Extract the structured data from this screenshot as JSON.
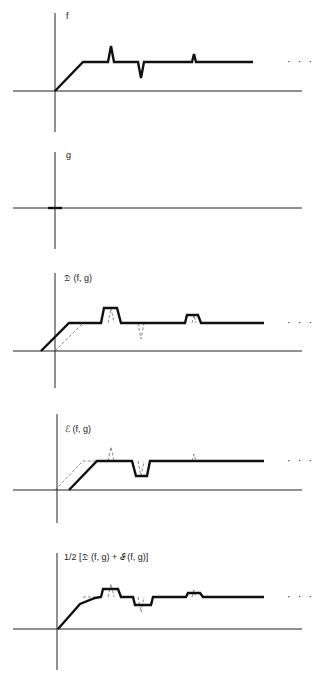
{
  "panels": [
    {
      "id": "f",
      "label": "f",
      "label_pos": [
        66,
        19
      ],
      "axes": {
        "vx": 55,
        "vy": [
          13,
          132
        ],
        "hy": 91,
        "hx": [
          13,
          302
        ]
      },
      "thick": [
        [
          [
            55,
            91
          ],
          [
            83,
            62
          ],
          [
            108,
            62
          ],
          [
            111,
            46
          ],
          [
            114,
            62
          ],
          [
            138,
            62
          ],
          [
            141,
            78
          ],
          [
            144,
            62
          ],
          [
            192,
            62
          ],
          [
            194,
            54
          ],
          [
            196,
            62
          ],
          [
            253,
            62
          ]
        ]
      ],
      "dashed": [],
      "ellipsis": "· · ·",
      "ellipsis_pos": [
        287,
        65
      ]
    },
    {
      "id": "g",
      "label": "g",
      "label_pos": [
        66,
        158
      ],
      "axes": {
        "vx": 55,
        "vy": [
          152,
          249
        ],
        "hy": 208,
        "hx": [
          13,
          302
        ]
      },
      "thick": [
        [
          [
            48,
            208
          ],
          [
            62,
            208
          ]
        ]
      ],
      "dashed": [],
      "ellipsis": "",
      "ellipsis_pos": [
        0,
        0
      ]
    },
    {
      "id": "dilation",
      "label": "𝔇 (f, g)",
      "label_pos": [
        64,
        281
      ],
      "axes": {
        "vx": 55,
        "vy": [
          273,
          388
        ],
        "hy": 351,
        "hx": [
          13,
          302
        ]
      },
      "thick": [
        [
          [
            41,
            351
          ],
          [
            69,
            323
          ],
          [
            101,
            323
          ],
          [
            104,
            308
          ],
          [
            117,
            308
          ],
          [
            121,
            323
          ],
          [
            185,
            323
          ],
          [
            187,
            315
          ],
          [
            198,
            315
          ],
          [
            201,
            323
          ],
          [
            264,
            323
          ]
        ]
      ],
      "dashed": [
        [
          [
            55,
            351
          ],
          [
            83,
            323
          ]
        ],
        [
          [
            108,
            323
          ],
          [
            111,
            308
          ],
          [
            114,
            323
          ]
        ],
        [
          [
            138,
            323
          ],
          [
            141,
            339
          ],
          [
            144,
            323
          ]
        ],
        [
          [
            192,
            323
          ],
          [
            194,
            315
          ],
          [
            196,
            323
          ]
        ]
      ],
      "ellipsis": "· · ·",
      "ellipsis_pos": [
        287,
        326
      ]
    },
    {
      "id": "erosion",
      "label": "ℰ (f, g)",
      "label_pos": [
        65,
        432
      ],
      "axes": {
        "vx": 57,
        "vy": [
          414,
          523
        ],
        "hy": 490,
        "hx": [
          13,
          302
        ]
      },
      "thick": [
        [
          [
            69,
            490
          ],
          [
            97,
            461
          ],
          [
            132,
            461
          ],
          [
            136,
            476
          ],
          [
            147,
            476
          ],
          [
            150,
            461
          ],
          [
            264,
            461
          ]
        ]
      ],
      "dashed": [
        [
          [
            55,
            490
          ],
          [
            83,
            461
          ],
          [
            97,
            461
          ]
        ],
        [
          [
            108,
            461
          ],
          [
            111,
            447
          ],
          [
            114,
            461
          ]
        ],
        [
          [
            138,
            461
          ],
          [
            141,
            476
          ],
          [
            144,
            461
          ]
        ],
        [
          [
            192,
            461
          ],
          [
            194,
            454
          ],
          [
            196,
            461
          ]
        ]
      ],
      "ellipsis": "· · ·",
      "ellipsis_pos": [
        287,
        464
      ]
    },
    {
      "id": "average",
      "label": "1/2 [𝔇 (f, g) + ℰ (f, g)]",
      "label_pos": [
        64,
        560
      ],
      "axes": {
        "vx": 57,
        "vy": [
          553,
          670
        ],
        "hy": 629,
        "hx": [
          13,
          302
        ]
      },
      "thick": [
        [
          [
            58,
            629
          ],
          [
            80,
            604
          ],
          [
            95,
            598
          ],
          [
            101,
            597
          ],
          [
            103,
            589
          ],
          [
            118,
            589
          ],
          [
            121,
            597
          ],
          [
            133,
            597
          ],
          [
            135,
            605
          ],
          [
            151,
            605
          ],
          [
            153,
            597
          ],
          [
            186,
            597
          ],
          [
            188,
            593
          ],
          [
            200,
            593
          ],
          [
            203,
            597
          ],
          [
            264,
            597
          ]
        ]
      ],
      "dashed": [
        [
          [
            83,
            597
          ],
          [
            95,
            597
          ]
        ],
        [
          [
            108,
            597
          ],
          [
            111,
            584
          ],
          [
            114,
            597
          ]
        ],
        [
          [
            138,
            597
          ],
          [
            141,
            612
          ],
          [
            144,
            597
          ]
        ],
        [
          [
            192,
            597
          ],
          [
            194,
            590
          ],
          [
            196,
            597
          ]
        ]
      ],
      "ellipsis": "· · ·",
      "ellipsis_pos": [
        287,
        600
      ]
    }
  ]
}
